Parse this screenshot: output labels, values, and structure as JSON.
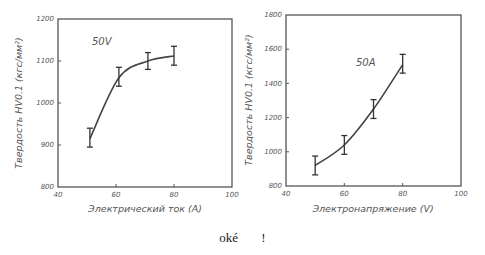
{
  "chart_data": [
    {
      "type": "line",
      "title": "",
      "annotation": "50V",
      "xlabel": "Электрический ток (A)",
      "ylabel": "Твердость HV0.1 (кгс/мм²)",
      "xlim": [
        40,
        100
      ],
      "ylim": [
        800,
        1200
      ],
      "xticks": [
        "40",
        "60",
        "80",
        "100"
      ],
      "yticks": [
        "800",
        "900",
        "1000",
        "1100",
        "1200"
      ],
      "grid": false,
      "legend": null,
      "series": [
        {
          "name": "50V",
          "x": [
            51,
            61,
            71,
            80
          ],
          "y": [
            915,
            1060,
            1100,
            1112
          ],
          "error_low": [
            895,
            1040,
            1080,
            1090
          ],
          "error_high": [
            940,
            1085,
            1120,
            1135
          ]
        }
      ]
    },
    {
      "type": "line",
      "title": "",
      "annotation": "50A",
      "xlabel": "Электронапряжение (V)",
      "ylabel": "Твердость HV0.1 (кгс/мм²)",
      "xlim": [
        40,
        100
      ],
      "ylim": [
        800,
        1800
      ],
      "xticks": [
        "40",
        "60",
        "80",
        "100"
      ],
      "yticks": [
        "800",
        "1000",
        "1200",
        "1400",
        "1600",
        "1800"
      ],
      "grid": false,
      "legend": null,
      "series": [
        {
          "name": "50A",
          "x": [
            50,
            60,
            70,
            80
          ],
          "y": [
            920,
            1040,
            1250,
            1510
          ],
          "error_low": [
            865,
            985,
            1195,
            1460
          ],
          "error_high": [
            975,
            1095,
            1305,
            1570
          ]
        }
      ]
    }
  ],
  "caption": {
    "word": "oké",
    "mark": "!"
  }
}
